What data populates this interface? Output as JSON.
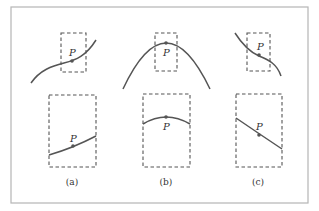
{
  "figure": {
    "panels": [
      {
        "id": "a",
        "caption": "(a)",
        "point_label": "P",
        "curve_shape": "increasing inflection curve",
        "zoomed_shape": "nearly straight increasing line"
      },
      {
        "id": "b",
        "caption": "(b)",
        "point_label": "P",
        "curve_shape": "downward parabola with maximum at P",
        "zoomed_shape": "shallow arc with maximum at P"
      },
      {
        "id": "c",
        "caption": "(c)",
        "point_label": "P",
        "curve_shape": "decreasing inflection curve",
        "zoomed_shape": "nearly straight decreasing line"
      }
    ],
    "colors": {
      "frame": "#b5b5b5",
      "line": "#555555",
      "text": "#333333"
    }
  }
}
